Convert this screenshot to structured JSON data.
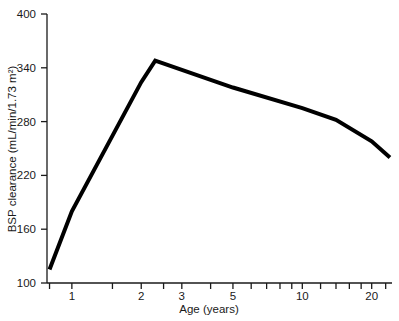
{
  "chart_data": {
    "type": "line",
    "title": "",
    "xlabel": "Age (years)",
    "ylabel": "BSP clearance (mL/min/1.73 m²)",
    "xscale": "log",
    "yscale": "linear",
    "xlim": [
      0.78,
      24.5
    ],
    "ylim": [
      100,
      400
    ],
    "grid": false,
    "legend": null,
    "x_tick_labels": [
      "1",
      "2",
      "3",
      "5",
      "10",
      "20"
    ],
    "x_tick_values": [
      1,
      2,
      3,
      5,
      10,
      20
    ],
    "x_minor_ticks": [
      0.8,
      1,
      1.5,
      2,
      2.5,
      3,
      4,
      5,
      6,
      7,
      8,
      9,
      10,
      12,
      14,
      16,
      18,
      20,
      23
    ],
    "y_tick_labels": [
      "100",
      "160",
      "220",
      "280",
      "340",
      "400"
    ],
    "y_tick_values": [
      100,
      160,
      220,
      280,
      340,
      400
    ],
    "series": [
      {
        "name": "BSP clearance",
        "color": "#000000",
        "line_width": 4,
        "x": [
          0.8,
          1.0,
          2.0,
          2.3,
          5.0,
          10.0,
          14.0,
          20.0,
          24.0
        ],
        "y": [
          115,
          180,
          324,
          348,
          318,
          295,
          282,
          258,
          240
        ]
      }
    ]
  },
  "axes": {
    "x_axis_name": "Age (years)",
    "y_axis_name": "BSP clearance (mL/min/1.73 m²)"
  }
}
